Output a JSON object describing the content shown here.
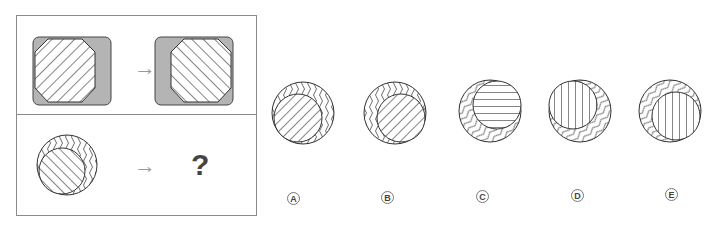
{
  "puzzle": {
    "example": {
      "from": {
        "shape": "octagon",
        "hatch": "diagonal-forward",
        "position": "left",
        "background": "#b4b4b4"
      },
      "arrow": "→",
      "to": {
        "shape": "octagon",
        "hatch": "diagonal-backward",
        "position": "right",
        "background": "#b4b4b4"
      }
    },
    "question": {
      "from": {
        "outer": "circle-wavy-vertical",
        "inner": "circle-diagonal-backward",
        "inner_position": "bottom-left"
      },
      "arrow": "→",
      "mark": "?"
    },
    "options": [
      {
        "label": "A",
        "inner_position": "bottom-left",
        "inner_hatch": "diagonal-forward",
        "outer_waves": "vertical"
      },
      {
        "label": "B",
        "inner_position": "bottom-right",
        "inner_hatch": "diagonal-forward",
        "outer_waves": "vertical"
      },
      {
        "label": "C",
        "inner_position": "top-right",
        "inner_hatch": "horizontal",
        "outer_waves": "diagonal"
      },
      {
        "label": "D",
        "inner_position": "top-left",
        "inner_hatch": "vertical",
        "outer_waves": "diagonal"
      },
      {
        "label": "E",
        "inner_position": "bottom-right",
        "inner_hatch": "vertical",
        "outer_waves": "diagonal"
      }
    ]
  },
  "colors": {
    "line": "#333333",
    "gray_fill": "#b4b4b4",
    "border": "#8a8a8a",
    "arrow": "#9a9a9a"
  }
}
